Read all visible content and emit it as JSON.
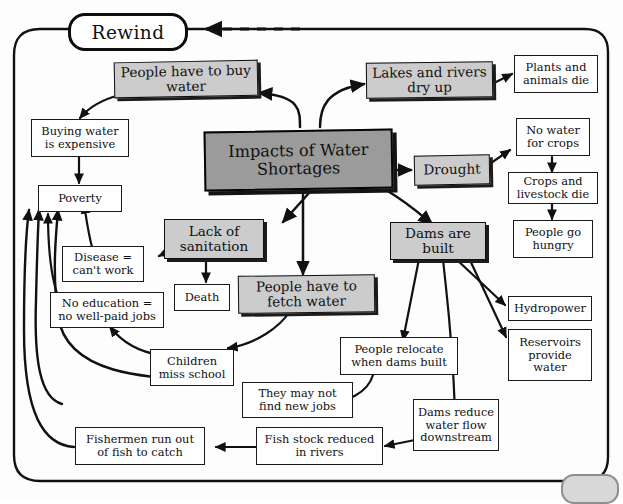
{
  "diagram": {
    "title_node": "Impacts of Water Shortages",
    "rewind_label": "Rewind",
    "accent_gray": "#cccccc",
    "center_gray": "#9b9b9b",
    "line_color": "#111111",
    "nodes": [
      {
        "id": "center",
        "label": "Impacts of Water Shortages",
        "style": "center"
      },
      {
        "id": "buy_water",
        "label": "People have to buy water",
        "style": "gray"
      },
      {
        "id": "lakes_dry",
        "label": "Lakes and rivers dry up",
        "style": "gray"
      },
      {
        "id": "drought",
        "label": "Drought",
        "style": "gray"
      },
      {
        "id": "sanitation",
        "label": "Lack of sanitation",
        "style": "gray"
      },
      {
        "id": "fetch_water",
        "label": "People have to fetch water",
        "style": "gray"
      },
      {
        "id": "dams_built",
        "label": "Dams are built",
        "style": "gray"
      },
      {
        "id": "buying_exp",
        "label": "Buying water is expensive",
        "style": "plain"
      },
      {
        "id": "poverty",
        "label": "Poverty",
        "style": "plain"
      },
      {
        "id": "disease",
        "label": "Disease = can't work",
        "style": "plain"
      },
      {
        "id": "no_education",
        "label": "No education = no well-paid jobs",
        "style": "plain"
      },
      {
        "id": "death",
        "label": "Death",
        "style": "plain"
      },
      {
        "id": "children",
        "label": "Children miss school",
        "style": "plain"
      },
      {
        "id": "no_new_jobs",
        "label": "They may not find new jobs",
        "style": "plain"
      },
      {
        "id": "fishermen",
        "label": "Fishermen run out of fish to catch",
        "style": "plain"
      },
      {
        "id": "fish_stock",
        "label": "Fish stock reduced in rivers",
        "style": "plain"
      },
      {
        "id": "relocate",
        "label": "People relocate when dams built",
        "style": "plain"
      },
      {
        "id": "dams_reduce",
        "label": "Dams reduce water flow downstream",
        "style": "plain"
      },
      {
        "id": "plants_die",
        "label": "Plants and animals die",
        "style": "plain"
      },
      {
        "id": "no_water_crops",
        "label": "No water for crops",
        "style": "plain"
      },
      {
        "id": "crops_die",
        "label": "Crops and livestock die",
        "style": "plain"
      },
      {
        "id": "hungry",
        "label": "People go hungry",
        "style": "plain"
      },
      {
        "id": "hydropower",
        "label": "Hydropower",
        "style": "plain"
      },
      {
        "id": "reservoirs",
        "label": "Reservoirs provide water",
        "style": "plain"
      }
    ],
    "edges": [
      {
        "from": "center",
        "to": "buy_water"
      },
      {
        "from": "center",
        "to": "lakes_dry"
      },
      {
        "from": "center",
        "to": "drought"
      },
      {
        "from": "center",
        "to": "sanitation"
      },
      {
        "from": "center",
        "to": "fetch_water"
      },
      {
        "from": "center",
        "to": "dams_built"
      },
      {
        "from": "buy_water",
        "to": "buying_exp"
      },
      {
        "from": "buying_exp",
        "to": "poverty"
      },
      {
        "from": "lakes_dry",
        "to": "plants_die"
      },
      {
        "from": "drought",
        "to": "no_water_crops"
      },
      {
        "from": "no_water_crops",
        "to": "crops_die"
      },
      {
        "from": "crops_die",
        "to": "hungry"
      },
      {
        "from": "sanitation",
        "to": "disease"
      },
      {
        "from": "sanitation",
        "to": "death"
      },
      {
        "from": "disease",
        "to": "poverty"
      },
      {
        "from": "fetch_water",
        "to": "children"
      },
      {
        "from": "children",
        "to": "no_education"
      },
      {
        "from": "no_education",
        "to": "poverty"
      },
      {
        "from": "dams_built",
        "to": "relocate"
      },
      {
        "from": "dams_built",
        "to": "dams_reduce"
      },
      {
        "from": "dams_built",
        "to": "hydropower"
      },
      {
        "from": "dams_built",
        "to": "reservoirs"
      },
      {
        "from": "relocate",
        "to": "no_new_jobs"
      },
      {
        "from": "no_new_jobs",
        "to": "poverty"
      },
      {
        "from": "dams_reduce",
        "to": "fish_stock"
      },
      {
        "from": "fish_stock",
        "to": "fishermen"
      },
      {
        "from": "fishermen",
        "to": "poverty"
      }
    ]
  }
}
